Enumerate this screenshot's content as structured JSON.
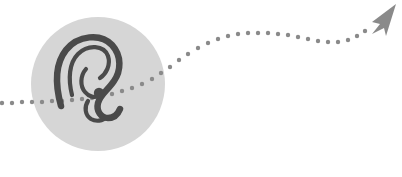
{
  "graphic": {
    "title": "Listening path illustration",
    "background_color": "#ffffff",
    "badge": {
      "icon_name": "ear-icon",
      "shape": "circle",
      "fill_color": "#d6d6d6",
      "center_x": 98,
      "center_y": 84,
      "radius": 67,
      "icon_color": "#4a4a4a",
      "icon_stroke_width": 6.5
    },
    "path": {
      "name": "dotted-trail",
      "dot_color": "#8a8a8a",
      "dot_radius": 2.2,
      "dot_spacing": 10,
      "description": "dotted trail entering from left edge, crossing the circle, rising to the upper right and ending at an arrowhead",
      "dots": [
        {
          "x": 2,
          "y": 103
        },
        {
          "x": 12,
          "y": 103
        },
        {
          "x": 22,
          "y": 102
        },
        {
          "x": 32,
          "y": 102
        },
        {
          "x": 42,
          "y": 102
        },
        {
          "x": 52,
          "y": 101
        },
        {
          "x": 62,
          "y": 101
        },
        {
          "x": 72,
          "y": 100
        },
        {
          "x": 82,
          "y": 99
        },
        {
          "x": 92,
          "y": 98
        },
        {
          "x": 102,
          "y": 96
        },
        {
          "x": 112,
          "y": 94
        },
        {
          "x": 122,
          "y": 91
        },
        {
          "x": 132,
          "y": 88
        },
        {
          "x": 142,
          "y": 84
        },
        {
          "x": 152,
          "y": 79
        },
        {
          "x": 161,
          "y": 73
        },
        {
          "x": 170,
          "y": 67
        },
        {
          "x": 179,
          "y": 60
        },
        {
          "x": 188,
          "y": 54
        },
        {
          "x": 198,
          "y": 48
        },
        {
          "x": 208,
          "y": 43
        },
        {
          "x": 218,
          "y": 39
        },
        {
          "x": 228,
          "y": 36
        },
        {
          "x": 238,
          "y": 34
        },
        {
          "x": 248,
          "y": 33
        },
        {
          "x": 258,
          "y": 33
        },
        {
          "x": 268,
          "y": 33
        },
        {
          "x": 278,
          "y": 34
        },
        {
          "x": 288,
          "y": 35
        },
        {
          "x": 298,
          "y": 37
        },
        {
          "x": 308,
          "y": 39
        },
        {
          "x": 318,
          "y": 41
        },
        {
          "x": 328,
          "y": 42
        },
        {
          "x": 338,
          "y": 42
        },
        {
          "x": 348,
          "y": 40
        },
        {
          "x": 357,
          "y": 36
        },
        {
          "x": 365,
          "y": 31
        }
      ]
    },
    "arrow": {
      "name": "arrowhead-icon",
      "color": "#8a8a8a",
      "tip_x": 396,
      "tip_y": 5,
      "style": "paper-plane",
      "points": "396,4 372,22 380,24 372,34 384,28 386,36"
    }
  }
}
